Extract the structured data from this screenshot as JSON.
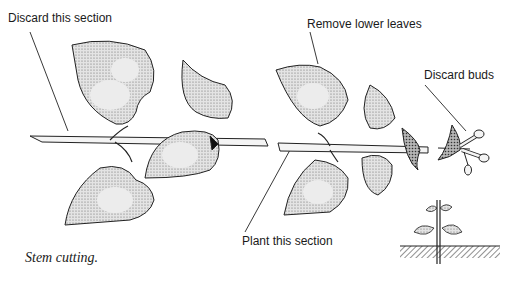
{
  "figure": {
    "title": "Stem cutting.",
    "labels": {
      "discard_section": "Discard this section",
      "remove_leaves": "Remove lower leaves",
      "discard_buds": "Discard buds",
      "plant_section": "Plant this section"
    },
    "caption": "Stem cutting.",
    "colors": {
      "ink": "#1a1a1a",
      "leaf_fill": "#d9d9d9",
      "leaf_shade": "#9a9a9a",
      "stem_fill": "#f2f2f2",
      "background": "#ffffff"
    }
  }
}
